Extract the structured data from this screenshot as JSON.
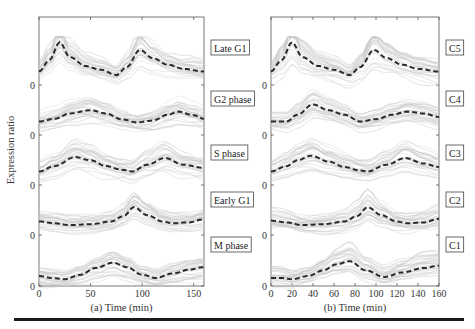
{
  "figure": {
    "ylabel": "Expression ratio",
    "colors": {
      "mean_line": "#2a2a2a",
      "profiles": "#c9c9c9",
      "frame": "#555555"
    }
  },
  "chart_data": [
    {
      "type": "line",
      "panel": "a",
      "xlabel": "(a) Time (min)",
      "ylabel": "Expression ratio",
      "xlim": [
        0,
        160
      ],
      "xticks": [
        0,
        50,
        100,
        150
      ],
      "ytick_label": "0",
      "grid": false,
      "legend": "labels to the right of each band",
      "series": [
        {
          "name": "Late G1",
          "x": [
            0,
            10,
            20,
            30,
            45,
            60,
            75,
            85,
            98,
            110,
            125,
            140,
            160
          ],
          "values": [
            0.3,
            0.55,
            0.95,
            0.62,
            0.42,
            0.34,
            0.22,
            0.4,
            0.78,
            0.6,
            0.45,
            0.36,
            0.3
          ]
        },
        {
          "name": "G2 phase",
          "x": [
            0,
            15,
            30,
            50,
            65,
            80,
            95,
            110,
            125,
            135,
            150,
            160
          ],
          "values": [
            0.3,
            0.36,
            0.48,
            0.55,
            0.48,
            0.35,
            0.28,
            0.32,
            0.45,
            0.52,
            0.44,
            0.36
          ]
        },
        {
          "name": "S phase",
          "x": [
            0,
            15,
            35,
            50,
            65,
            80,
            90,
            105,
            122,
            140,
            160
          ],
          "values": [
            0.3,
            0.42,
            0.62,
            0.55,
            0.42,
            0.34,
            0.3,
            0.45,
            0.6,
            0.45,
            0.38
          ]
        },
        {
          "name": "Early G1",
          "x": [
            0,
            15,
            30,
            50,
            70,
            82,
            92,
            105,
            120,
            130,
            145,
            160
          ],
          "values": [
            0.3,
            0.26,
            0.22,
            0.24,
            0.3,
            0.42,
            0.62,
            0.44,
            0.3,
            0.26,
            0.28,
            0.35
          ]
        },
        {
          "name": "M phase",
          "x": [
            0,
            12,
            25,
            40,
            55,
            72,
            85,
            100,
            113,
            130,
            145,
            160
          ],
          "values": [
            0.22,
            0.18,
            0.15,
            0.25,
            0.4,
            0.52,
            0.42,
            0.25,
            0.18,
            0.28,
            0.36,
            0.42
          ]
        }
      ]
    },
    {
      "type": "line",
      "panel": "b",
      "xlabel": "(b) Time (min)",
      "ylabel": "",
      "xlim": [
        0,
        160
      ],
      "xticks": [
        0,
        20,
        40,
        60,
        80,
        100,
        120,
        140,
        160
      ],
      "ytick_label": "0",
      "grid": false,
      "legend": "labels to the right of each band",
      "series": [
        {
          "name": "C5",
          "x": [
            0,
            10,
            20,
            30,
            45,
            60,
            75,
            85,
            98,
            110,
            125,
            140,
            160
          ],
          "values": [
            0.3,
            0.55,
            0.95,
            0.62,
            0.42,
            0.34,
            0.22,
            0.4,
            0.78,
            0.6,
            0.45,
            0.36,
            0.3
          ]
        },
        {
          "name": "C4",
          "x": [
            0,
            15,
            25,
            40,
            55,
            70,
            85,
            100,
            115,
            130,
            145,
            160
          ],
          "values": [
            0.3,
            0.3,
            0.45,
            0.68,
            0.55,
            0.45,
            0.3,
            0.35,
            0.45,
            0.52,
            0.48,
            0.4
          ]
        },
        {
          "name": "C3",
          "x": [
            0,
            15,
            25,
            38,
            55,
            70,
            85,
            92,
            110,
            128,
            145,
            160
          ],
          "values": [
            0.3,
            0.42,
            0.55,
            0.65,
            0.52,
            0.4,
            0.32,
            0.3,
            0.45,
            0.6,
            0.48,
            0.4
          ]
        },
        {
          "name": "C2",
          "x": [
            0,
            15,
            30,
            50,
            70,
            82,
            92,
            105,
            120,
            130,
            145,
            160
          ],
          "values": [
            0.32,
            0.28,
            0.22,
            0.24,
            0.3,
            0.42,
            0.62,
            0.44,
            0.3,
            0.26,
            0.28,
            0.36
          ]
        },
        {
          "name": "C1",
          "x": [
            0,
            10,
            20,
            35,
            50,
            62,
            75,
            90,
            108,
            125,
            145,
            160
          ],
          "values": [
            0.18,
            0.18,
            0.15,
            0.22,
            0.35,
            0.48,
            0.55,
            0.35,
            0.2,
            0.3,
            0.4,
            0.45
          ]
        }
      ]
    }
  ]
}
